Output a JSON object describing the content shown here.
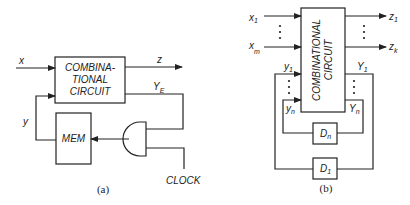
{
  "figure": {
    "panel_a": {
      "caption": "(a)",
      "combinational_block": {
        "lines": [
          "COMBINA-",
          "TIONAL",
          "CIRCUIT"
        ]
      },
      "memory_block": {
        "label": "MEM"
      },
      "gate": {
        "type": "AND"
      },
      "signals": {
        "input": "x",
        "output": "z",
        "state": "y",
        "excitation": "Y",
        "excitation_sub": "E",
        "clock": "CLOCK"
      }
    },
    "panel_b": {
      "caption": "(b)",
      "combinational_block": {
        "lines": [
          "COMBINATIONAL",
          "CIRCUIT"
        ]
      },
      "inputs": {
        "first": "x",
        "first_sub": "1",
        "last": "x",
        "last_sub": "m"
      },
      "outputs": {
        "first": "z",
        "first_sub": "1",
        "last": "z",
        "last_sub": "k"
      },
      "state_inputs": {
        "first": "y",
        "first_sub": "1",
        "last": "y",
        "last_sub": "n"
      },
      "state_outputs": {
        "first": "Y",
        "first_sub": "1",
        "last": "Y",
        "last_sub": "n"
      },
      "delays": [
        {
          "label": "D",
          "sub": "n"
        },
        {
          "label": "D",
          "sub": "1"
        }
      ]
    }
  }
}
